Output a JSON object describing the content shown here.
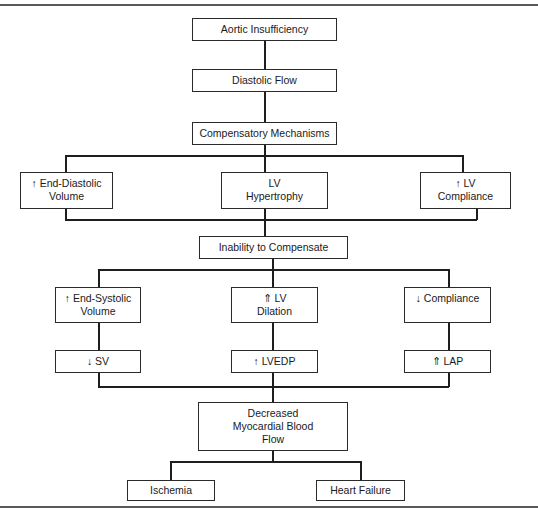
{
  "diagram": {
    "nodes": {
      "aortic_insufficiency": "Aortic Insufficiency",
      "diastolic_flow": "Diastolic Flow",
      "compensatory_mechanisms": "Compensatory Mechanisms",
      "end_diastolic_volume": "↑  End-Diastolic\nVolume",
      "lv_hypertrophy": "LV\nHypertrophy",
      "lv_compliance": "↑ LV\nCompliance",
      "inability_to_compensate": "Inability to Compensate",
      "end_systolic_volume": "↑  End-Systolic\nVolume",
      "lv_dilation": "⇑ LV\nDilation",
      "decreased_compliance": "↓  Compliance",
      "sv": "↓  SV",
      "lvedp": "↑  LVEDP",
      "lap": "⇑ LAP",
      "decreased_myocardial_blood_flow": "Decreased\nMyocardial Blood\nFlow",
      "ischemia": "Ischemia",
      "heart_failure": "Heart Failure"
    },
    "edges": [
      [
        "aortic_insufficiency",
        "diastolic_flow"
      ],
      [
        "diastolic_flow",
        "compensatory_mechanisms"
      ],
      [
        "compensatory_mechanisms",
        "end_diastolic_volume"
      ],
      [
        "compensatory_mechanisms",
        "lv_hypertrophy"
      ],
      [
        "compensatory_mechanisms",
        "lv_compliance"
      ],
      [
        "end_diastolic_volume",
        "inability_to_compensate"
      ],
      [
        "lv_hypertrophy",
        "inability_to_compensate"
      ],
      [
        "lv_compliance",
        "inability_to_compensate"
      ],
      [
        "inability_to_compensate",
        "end_systolic_volume"
      ],
      [
        "inability_to_compensate",
        "lv_dilation"
      ],
      [
        "inability_to_compensate",
        "decreased_compliance"
      ],
      [
        "end_systolic_volume",
        "sv"
      ],
      [
        "lv_dilation",
        "lvedp"
      ],
      [
        "decreased_compliance",
        "lap"
      ],
      [
        "sv",
        "decreased_myocardial_blood_flow"
      ],
      [
        "lvedp",
        "decreased_myocardial_blood_flow"
      ],
      [
        "lap",
        "decreased_myocardial_blood_flow"
      ],
      [
        "decreased_myocardial_blood_flow",
        "ischemia"
      ],
      [
        "decreased_myocardial_blood_flow",
        "heart_failure"
      ]
    ]
  }
}
